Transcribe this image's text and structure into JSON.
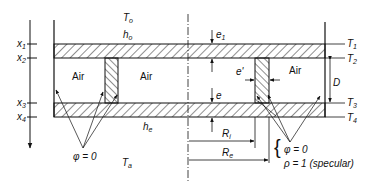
{
  "figure": {
    "ambient_top": {
      "main": "T",
      "sub": "o"
    },
    "coef_top": {
      "main": "h",
      "sub": "o"
    },
    "ambient_bottom": {
      "main": "T",
      "sub": "a"
    },
    "coef_bottom": {
      "main": "h",
      "sub": "e"
    },
    "air_labels": [
      "Air",
      "Air",
      "Air"
    ],
    "x_positions": [
      {
        "main": "x",
        "sub": "1"
      },
      {
        "main": "x",
        "sub": "2"
      },
      {
        "main": "x",
        "sub": "3"
      },
      {
        "main": "x",
        "sub": "4"
      }
    ],
    "temperatures": [
      {
        "main": "T",
        "sub": "1"
      },
      {
        "main": "T",
        "sub": "2"
      },
      {
        "main": "T",
        "sub": "3"
      },
      {
        "main": "T",
        "sub": "4"
      }
    ],
    "dimensions": {
      "e1": {
        "main": "e",
        "sub": "1"
      },
      "e": "e",
      "e_prime": "e'",
      "D": "D",
      "Ri": {
        "main": "R",
        "sub": "i"
      },
      "Re": {
        "main": "R",
        "sub": "e"
      }
    },
    "left_condition": "φ = 0",
    "right_condition_1": "φ = 0",
    "right_condition_2": "ρ = 1  (specular)"
  }
}
